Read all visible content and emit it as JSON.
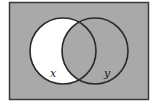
{
  "diagram": {
    "type": "venn",
    "universe": {
      "fill": "#a9a9a9",
      "stroke": "#3a3a3a"
    },
    "sets": [
      {
        "name": "x",
        "label": "x",
        "cx": 63,
        "cy": 51,
        "r": 33
      },
      {
        "name": "y",
        "label": "y",
        "cx": 95,
        "cy": 51,
        "r": 33
      }
    ],
    "shaded_region": "x only (x minus y)",
    "shaded_color": "#ffffff",
    "circle_stroke": "#2a2a2a"
  }
}
